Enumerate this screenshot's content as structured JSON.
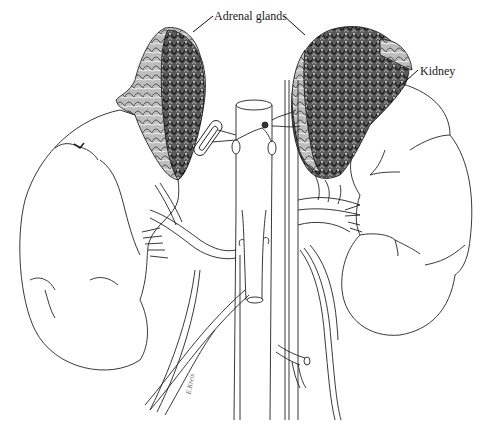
{
  "figure": {
    "type": "anatomical line drawing",
    "background": "#ffffff",
    "ink_color": "#1a1a1a"
  },
  "labels": {
    "adrenal_glands": "Adrenal glands",
    "kidney": "Kidney"
  },
  "signature": "E.Kreis",
  "structures": [
    {
      "name": "left-adrenal-gland",
      "side": "viewer-left"
    },
    {
      "name": "right-adrenal-gland",
      "side": "viewer-right"
    },
    {
      "name": "left-kidney",
      "side": "viewer-left"
    },
    {
      "name": "right-kidney",
      "side": "viewer-right"
    },
    {
      "name": "aorta",
      "side": "center"
    },
    {
      "name": "inferior-vena-cava",
      "side": "center"
    },
    {
      "name": "left-ureter",
      "side": "viewer-left"
    },
    {
      "name": "right-ureter",
      "side": "viewer-right"
    }
  ]
}
